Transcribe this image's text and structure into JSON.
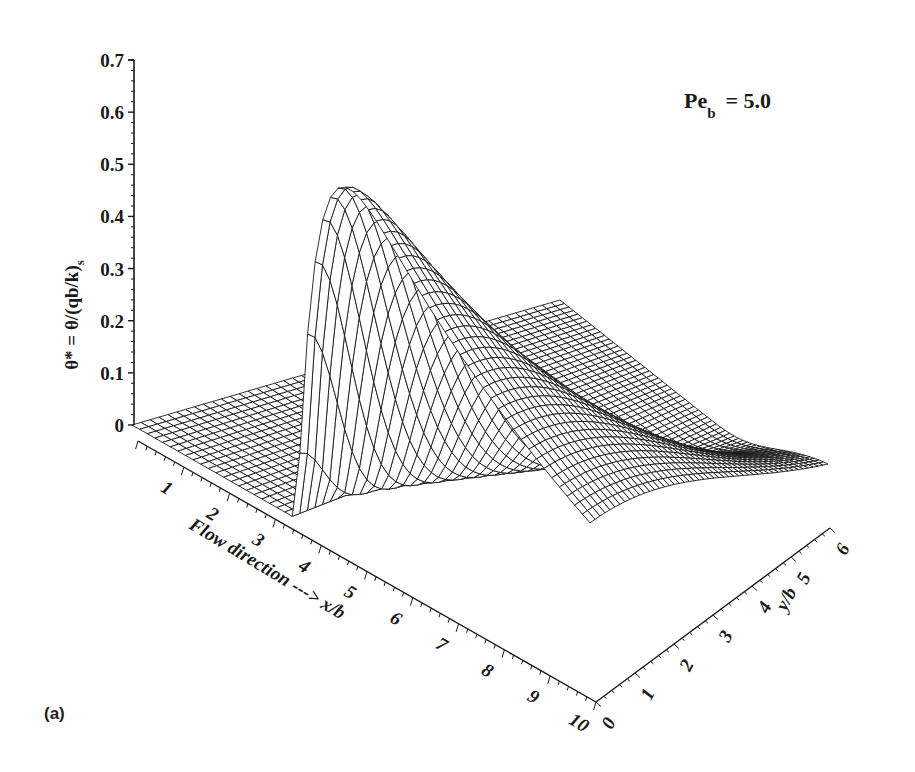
{
  "chart_data": {
    "type": "surface3d",
    "title": "",
    "annotation": "Pe_b = 5.0",
    "annotation_main": "Pe",
    "annotation_sub": "b",
    "annotation_rest": "= 5.0",
    "panel_label": "(a)",
    "xlabel": "Flow direction ---> x/b",
    "ylabel": "y/b",
    "zlabel": "θ* = θ/(qb/k)",
    "zlabel_sub": "s",
    "x_ticks": [
      1,
      2,
      3,
      4,
      5,
      6,
      7,
      8,
      9,
      10
    ],
    "y_ticks": [
      0,
      1,
      2,
      3,
      4,
      5,
      6
    ],
    "z_ticks": [
      "0",
      "0.1",
      "0.2",
      "0.3",
      "0.4",
      "0.5",
      "0.6",
      "0.7"
    ],
    "xlim": [
      0,
      10
    ],
    "ylim": [
      0,
      6
    ],
    "zlim": [
      0,
      0.7
    ],
    "peak": {
      "x": 4.5,
      "y": 0.0,
      "z": 0.6
    },
    "surface_description": "Zero for x/b < ~3.5; sharp rise to peak ≈0.6 near x/b≈4.5, y/b≈0; decays downstream and spreads laterally in y/b; near-zero at y/b=6.",
    "grid_resolution": {
      "nx": 60,
      "ny": 48
    },
    "colors": {
      "line": "#1a1a1a",
      "fill": "#ffffff",
      "background": "#ffffff"
    }
  }
}
